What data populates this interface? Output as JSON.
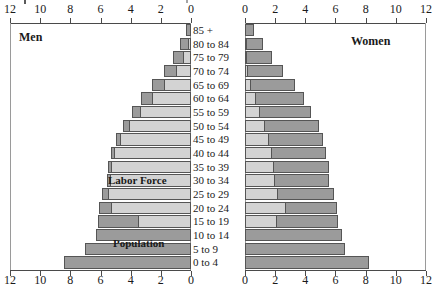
{
  "chart_data": {
    "type": "bar",
    "subtype": "population-pyramid",
    "title": "",
    "xlabel": "",
    "ylabel": "",
    "xlim_left": [
      12,
      0
    ],
    "xlim_right": [
      0,
      12
    ],
    "axis_ticks_left": [
      "12",
      "10",
      "8",
      "6",
      "4",
      "2",
      "0"
    ],
    "axis_ticks_right": [
      "0",
      "2",
      "4",
      "6",
      "8",
      "10",
      "12"
    ],
    "axis_tick_values": [
      12,
      10,
      8,
      6,
      4,
      2,
      0
    ],
    "grid": false,
    "legend_position": "in-plot-annotations",
    "panel_labels": {
      "left": "Men",
      "right": "Women"
    },
    "annotations": [
      {
        "text": "Labor Force",
        "side": "left",
        "age_group": "35 to 39"
      },
      {
        "text": "Population",
        "side": "left",
        "age_group": "5 to 9"
      }
    ],
    "categories": [
      "85 +",
      "80 to 84",
      "75 to 79",
      "70 to 74",
      "65 to 69",
      "60 to 64",
      "55 to 59",
      "50 to 54",
      "45 to 49",
      "40 to 44",
      "35 to 39",
      "30 to 34",
      "25 to 29",
      "20 to 24",
      "15 to 19",
      "10 to 14",
      "5 to 9",
      "0 to 4"
    ],
    "series": [
      {
        "name": "Population",
        "side": "left",
        "group": "Men",
        "color": "#9b9b9b",
        "values": [
          0.3,
          0.7,
          1.2,
          1.8,
          2.6,
          3.3,
          3.9,
          4.5,
          5.0,
          5.3,
          5.5,
          5.6,
          5.9,
          6.1,
          6.2,
          6.3,
          7.0,
          8.4
        ]
      },
      {
        "name": "Labor Force",
        "side": "left",
        "group": "Men",
        "color": "#d3d3d3",
        "values": [
          0.0,
          0.2,
          0.5,
          1.0,
          1.8,
          2.6,
          3.4,
          4.1,
          4.7,
          5.1,
          5.3,
          5.4,
          5.5,
          5.3,
          3.5,
          0.0,
          0.0,
          0.0
        ]
      },
      {
        "name": "Population",
        "side": "right",
        "group": "Women",
        "color": "#9b9b9b",
        "values": [
          0.6,
          1.2,
          1.8,
          2.5,
          3.3,
          3.9,
          4.4,
          4.9,
          5.2,
          5.4,
          5.6,
          5.6,
          5.9,
          6.1,
          6.2,
          6.4,
          6.6,
          8.2
        ]
      },
      {
        "name": "Labor Force",
        "side": "right",
        "group": "Women",
        "color": "#d3d3d3",
        "values": [
          0.0,
          0.05,
          0.1,
          0.2,
          0.4,
          0.7,
          1.0,
          1.3,
          1.6,
          1.8,
          1.9,
          2.0,
          2.2,
          2.7,
          2.1,
          0.0,
          0.0,
          0.0
        ]
      }
    ]
  },
  "axis_top_left": {
    "labels": [
      "12",
      "10",
      "8",
      "6",
      "4",
      "2",
      "0"
    ]
  },
  "axis_top_right": {
    "labels": [
      "0",
      "2",
      "4",
      "6",
      "8",
      "10",
      "12"
    ]
  },
  "axis_bottom_left": {
    "labels": [
      "12",
      "10",
      "8",
      "6",
      "4",
      "2",
      "0"
    ]
  },
  "axis_bottom_right": {
    "labels": [
      "0",
      "2",
      "4",
      "6",
      "8",
      "10",
      "12"
    ]
  },
  "labels": {
    "men": "Men",
    "women": "Women",
    "labor_force": "Labor Force",
    "population": "Population"
  },
  "colors": {
    "population_fill": "#9b9b9b",
    "labor_force_fill": "#d3d3d3",
    "bar_stroke": "#555555",
    "axis": "#4a4a4a",
    "frame": "#9a9a9a",
    "text": "#1a1a1a",
    "background": "#ffffff"
  }
}
